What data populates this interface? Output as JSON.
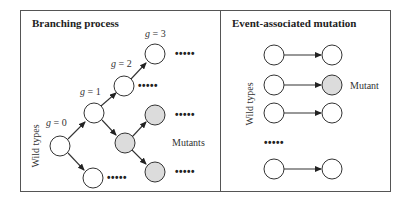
{
  "left_panel": {
    "title": "Branching process",
    "axis_label": "Wild types",
    "generations": [
      "g = 0",
      "g = 1",
      "g = 2",
      "g = 3"
    ],
    "gen_var": "g",
    "gen_values": [
      "= 0",
      "= 1",
      "= 2",
      "= 3"
    ],
    "mutants_label": "Mutants",
    "ellipsis": "•••••"
  },
  "right_panel": {
    "title": "Event-associated mutation",
    "axis_label": "Wild types",
    "mutant_label": "Mutant",
    "ellipsis": "•••••"
  },
  "colors": {
    "wild_type_fill": "#ffffff",
    "mutant_fill": "#dcdcdc",
    "stroke": "#333333",
    "frame": "#555555"
  }
}
